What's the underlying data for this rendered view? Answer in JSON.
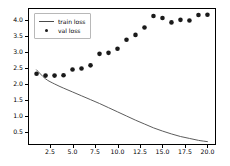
{
  "chart_data": {
    "type": "line",
    "title": "",
    "xlabel": "",
    "ylabel": "",
    "xlim": [
      0.05,
      20.95
    ],
    "ylim": [
      0.105,
      4.38
    ],
    "grid": false,
    "legend_position": "upper left",
    "x": [
      1,
      2,
      3,
      4,
      5,
      6,
      7,
      8,
      9,
      10,
      11,
      12,
      13,
      14,
      15,
      16,
      17,
      18,
      19,
      20
    ],
    "xticks": [
      2.5,
      5.0,
      7.5,
      10.0,
      12.5,
      15.0,
      17.5,
      20.0
    ],
    "xtick_labels": [
      "2.5",
      "5.0",
      "7.5",
      "10.0",
      "12.5",
      "15.0",
      "17.5",
      "20.0"
    ],
    "yticks": [
      0.5,
      1.0,
      1.5,
      2.0,
      2.5,
      3.0,
      3.5,
      4.0
    ],
    "ytick_labels": [
      "0.5",
      "1.0",
      "1.5",
      "2.0",
      "2.5",
      "3.0",
      "3.5",
      "4.0"
    ],
    "series": [
      {
        "name": "train loss",
        "style": "line",
        "color": "#4a4a4a",
        "values": [
          2.45,
          2.17,
          2.01,
          1.88,
          1.76,
          1.64,
          1.52,
          1.4,
          1.27,
          1.14,
          1.01,
          0.88,
          0.76,
          0.64,
          0.54,
          0.45,
          0.37,
          0.31,
          0.25,
          0.21
        ]
      },
      {
        "name": "val loss",
        "style": "scatter",
        "color": "#1a1a1a",
        "values": [
          2.33,
          2.27,
          2.27,
          2.28,
          2.46,
          2.49,
          2.59,
          2.95,
          2.98,
          3.11,
          3.39,
          3.54,
          3.77,
          4.13,
          4.07,
          3.93,
          4.01,
          3.99,
          4.16,
          4.17
        ]
      }
    ]
  },
  "legend": {
    "entries": [
      {
        "label": "train loss",
        "marker": "line"
      },
      {
        "label": "val loss",
        "marker": "dot"
      }
    ]
  }
}
